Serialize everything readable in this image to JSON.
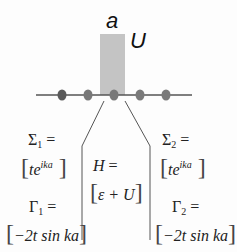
{
  "diagram": {
    "labels": {
      "a": "a",
      "U": "U"
    },
    "chain": {
      "sites": 5,
      "site_colors": [
        "#5a5a5a",
        "#787878",
        "#787878",
        "#7a7a7a",
        "#7a7a7a"
      ],
      "line_color": "#555555",
      "barrier_color": "#c4c4c4"
    },
    "left_lead": {
      "sigma_label": "Σ",
      "sigma_sub": "1",
      "eq": " =",
      "sigma_value_base": "te",
      "sigma_value_exp": "ika",
      "gamma_label": "Γ",
      "gamma_sub": "1",
      "gamma_value": "−2t sin ka"
    },
    "device": {
      "h_label": "H",
      "eq": " =",
      "h_value": "ε + U"
    },
    "right_lead": {
      "sigma_label": "Σ",
      "sigma_sub": "2",
      "eq": " =",
      "sigma_value_base": "te",
      "sigma_value_exp": "ika",
      "gamma_label": "Γ",
      "gamma_sub": "2",
      "gamma_value": "−2t sin ka"
    }
  }
}
